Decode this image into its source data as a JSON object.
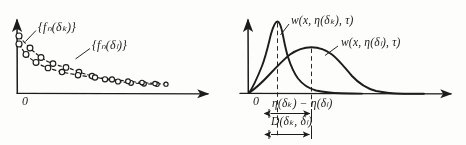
{
  "figure": {
    "background_color": "#fdfdfc",
    "ink_color": "#1b1b1b"
  },
  "left_panel": {
    "name": "sequence-plot",
    "origin_label": "0",
    "axes": {
      "x_axis": {
        "y": 93,
        "x_start": 17,
        "x_end": 216,
        "arrow": true
      },
      "y_axis": {
        "x": 17,
        "y_start": 93,
        "y_end": 14,
        "arrow": true
      }
    },
    "labels": [
      {
        "id": "label-fn-delta-k",
        "text": "{f",
        "sub": "n",
        "tail": "(δ",
        "tail_sub": "k",
        "tail2": ")}",
        "full": "{fₙ(δₖ)}",
        "x": 38,
        "y": 26
      },
      {
        "id": "label-fn-delta-l",
        "text": "{f",
        "sub": "n",
        "tail": "(δ",
        "tail_sub": "l",
        "tail2": ")}",
        "full": "{fₙ(δₗ)}",
        "x": 92,
        "y": 44
      }
    ],
    "series": [
      {
        "name": "fn-delta-k",
        "style": "dashed-with-open-circles",
        "points": [
          [
            19,
            36
          ],
          [
            30,
            48
          ],
          [
            41,
            57
          ],
          [
            53,
            63
          ],
          [
            66,
            67
          ],
          [
            79,
            72
          ],
          [
            92,
            76
          ],
          [
            105,
            79
          ],
          [
            118,
            81
          ],
          [
            131,
            82
          ],
          [
            144,
            83
          ],
          [
            157,
            84
          ]
        ]
      },
      {
        "name": "fn-delta-l",
        "style": "dashed-with-open-circles",
        "points": [
          [
            19,
            44
          ],
          [
            26,
            54
          ],
          [
            36,
            62
          ],
          [
            48,
            68
          ],
          [
            62,
            72
          ],
          [
            78,
            75
          ],
          [
            95,
            77
          ],
          [
            112,
            79
          ],
          [
            128,
            81
          ],
          [
            142,
            82
          ],
          [
            155,
            83
          ],
          [
            166,
            84
          ]
        ]
      }
    ],
    "leader_lines": [
      {
        "name": "leader-to-fn-delta-k",
        "from": [
          36,
          30
        ],
        "to": [
          26,
          41
        ]
      },
      {
        "name": "leader-to-fn-delta-l",
        "from": [
          90,
          48
        ],
        "to": [
          76,
          59
        ]
      }
    ]
  },
  "right_panel": {
    "name": "density-plot",
    "origin_label": "0",
    "axes": {
      "x_axis": {
        "y": 93,
        "x_start": 248,
        "x_end": 459,
        "arrow": true
      },
      "y_axis": {
        "x": 248,
        "y_start": 93,
        "y_end": 14,
        "arrow": true
      }
    },
    "curves": [
      {
        "name": "density-delta-k",
        "peak_x": 277,
        "peak_y": 22,
        "label": "w(x, η(δₖ), τ)"
      },
      {
        "name": "density-delta-l",
        "peak_x": 311,
        "peak_y": 48,
        "label": "w(x, η(δₗ), τ)"
      }
    ],
    "labels": [
      {
        "id": "label-w-delta-k",
        "full": "w(x, η(δₖ), τ)",
        "x": 292,
        "y": 19
      },
      {
        "id": "label-w-delta-l",
        "full": "w(x, η(δₗ), τ)",
        "x": 341,
        "y": 41
      }
    ],
    "dashed_guides": [
      {
        "name": "guide-peak-delta-k",
        "x": 277,
        "y_top": 22,
        "y_bottom": 136
      },
      {
        "name": "guide-peak-delta-l",
        "x": 311,
        "y_top": 48,
        "y_bottom": 136
      }
    ],
    "measure_eta": {
      "name": "eta-difference-measure",
      "label": "η(δₖ) − η(δₗ)",
      "label_x": 277,
      "label_y": 98,
      "arrow_y": 114,
      "arrow_x_start": 269,
      "arrow_x_end": 311
    },
    "measure_d": {
      "name": "d-distance-measure",
      "label": "D(δₖ, δₗ)",
      "label_x": 272,
      "label_y": 116,
      "arrow_y": 135,
      "arrow_x_start": 269,
      "arrow_x_end": 311
    }
  }
}
